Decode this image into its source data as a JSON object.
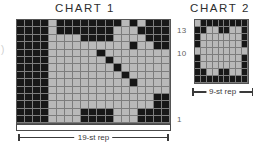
{
  "charts": [
    {
      "id": "chart-1",
      "title": "CHART 1",
      "repeat_label": "19-st rep",
      "stitches": 19,
      "rows": 14,
      "row_labels": [
        {
          "row": 13,
          "text": "13"
        },
        {
          "row": 10,
          "text": "10"
        },
        {
          "row": 1,
          "text": "1"
        }
      ],
      "legend": {
        "dark": "#171717",
        "light": "#b9b9b9"
      },
      "grid": [
        "DDDDLDDDDDDDDLDLDDD",
        "DDDDLDDDDDDDLLLDDDD",
        "DDDDLLLLDDDDLLLLDDD",
        "DDDDLLLLLLLLLLDLLDD",
        "DDDDLLLLLLDLLLLLLLL",
        "DDDDLLLLLLLDLLLLLLL",
        "DDDDLLLLLLLLDLLLLLL",
        "DDDDLLLLLLLLLDLLLLL",
        "DDDDLLLLLLLLLLDLLLL",
        "DDDDLLLLLLLLLLLLLLL",
        "DDDDLLLLLLLLLLLLLDD",
        "DDDDLLLLLLLLLLLLLDD",
        "DDDDLLLLDDDDLLLDDDD",
        "DDDDLLLLDDDDLLLDDDD"
      ]
    },
    {
      "id": "chart-2",
      "title": "CHART 2",
      "repeat_label": "9-st rep",
      "stitches": 9,
      "rows": 9,
      "legend": {
        "dark": "#171717",
        "light": "#b9b9b9"
      },
      "grid": [
        "LDDDDDDDD",
        "DDLLDDLLD",
        "DLLLLLLLD",
        "DLLLLLLLD",
        "LLLLLLLLL",
        "DLLLLLLLD",
        "DLLLLLLLD",
        "DDLLDDLLD",
        "DDDDDDDDD"
      ]
    }
  ]
}
